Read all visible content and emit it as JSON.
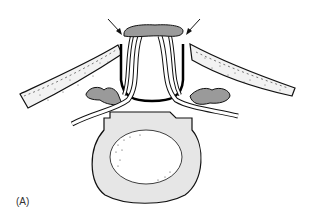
{
  "figure": {
    "panel_label": "(A)",
    "colors": {
      "outline": "#111111",
      "gray_fill": "#9a9a9a",
      "light_fill": "#e6e6e6",
      "band_fill": "#f2f2f2",
      "background": "#ffffff"
    },
    "parts": [
      "left-arrow",
      "right-arrow",
      "ligamentum-flavum",
      "spinal-canal",
      "left-dotted-band",
      "right-dotted-band",
      "left-facet",
      "right-facet",
      "left-nerve-root",
      "right-nerve-root",
      "vertebral-body",
      "nucleus"
    ]
  }
}
